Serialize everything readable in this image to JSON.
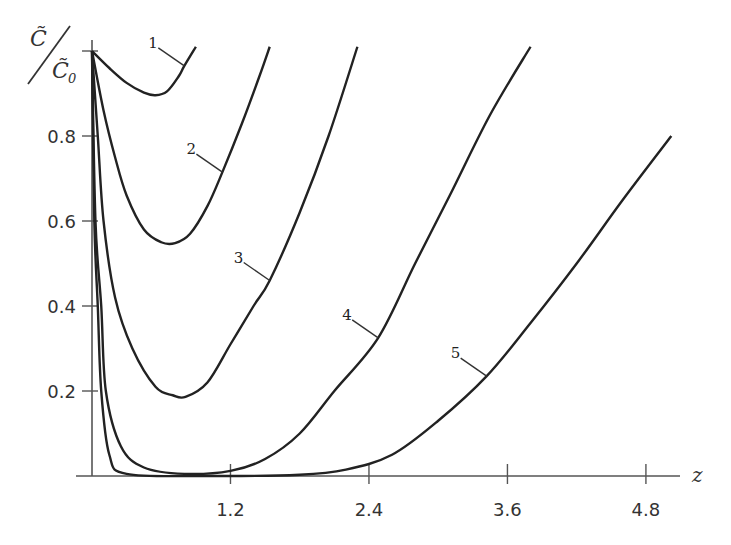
{
  "chart_data": {
    "type": "line",
    "title": "",
    "xlabel": "z",
    "ylabel": "C̃/C̃0",
    "ylabel_parts": {
      "numerator": "C̃",
      "denominator": "C̃",
      "subscript": "0"
    },
    "xlim": [
      0,
      5.1
    ],
    "ylim": [
      0,
      1.0
    ],
    "x_ticks": [
      1.2,
      2.4,
      3.6,
      4.8
    ],
    "x_tick_labels": [
      "1.2",
      "2.4",
      "3.6",
      "4.8"
    ],
    "y_ticks": [
      0.2,
      0.4,
      0.6,
      0.8,
      1.0
    ],
    "y_tick_labels": [
      "0.2",
      "0.4",
      "0.6",
      "0.8",
      ""
    ],
    "grid": false,
    "legend": "inline curve labels",
    "series": [
      {
        "name": "1",
        "points": [
          [
            0,
            1.0
          ],
          [
            0.15,
            0.96
          ],
          [
            0.3,
            0.925
          ],
          [
            0.45,
            0.902
          ],
          [
            0.55,
            0.896
          ],
          [
            0.65,
            0.905
          ],
          [
            0.75,
            0.94
          ],
          [
            0.8,
            0.965
          ],
          [
            0.9,
            1.01
          ]
        ]
      },
      {
        "name": "2",
        "points": [
          [
            0,
            1.0
          ],
          [
            0.1,
            0.86
          ],
          [
            0.2,
            0.75
          ],
          [
            0.3,
            0.66
          ],
          [
            0.45,
            0.58
          ],
          [
            0.6,
            0.55
          ],
          [
            0.72,
            0.548
          ],
          [
            0.85,
            0.57
          ],
          [
            1.0,
            0.635
          ],
          [
            1.13,
            0.715
          ],
          [
            1.3,
            0.83
          ],
          [
            1.45,
            0.94
          ],
          [
            1.54,
            1.01
          ]
        ]
      },
      {
        "name": "3",
        "points": [
          [
            0,
            1.0
          ],
          [
            0.05,
            0.8
          ],
          [
            0.1,
            0.6
          ],
          [
            0.2,
            0.42
          ],
          [
            0.35,
            0.3
          ],
          [
            0.55,
            0.21
          ],
          [
            0.7,
            0.19
          ],
          [
            0.81,
            0.186
          ],
          [
            1.0,
            0.22
          ],
          [
            1.2,
            0.31
          ],
          [
            1.4,
            0.4
          ],
          [
            1.54,
            0.46
          ],
          [
            1.8,
            0.62
          ],
          [
            2.05,
            0.8
          ],
          [
            2.3,
            1.01
          ]
        ]
      },
      {
        "name": "4",
        "points": [
          [
            0,
            1.0
          ],
          [
            0.03,
            0.6
          ],
          [
            0.08,
            0.4
          ],
          [
            0.12,
            0.2
          ],
          [
            0.25,
            0.07
          ],
          [
            0.45,
            0.02
          ],
          [
            0.8,
            0.005
          ],
          [
            1.2,
            0.012
          ],
          [
            1.5,
            0.04
          ],
          [
            1.8,
            0.1
          ],
          [
            2.1,
            0.2
          ],
          [
            2.48,
            0.325
          ],
          [
            2.8,
            0.5
          ],
          [
            3.1,
            0.66
          ],
          [
            3.45,
            0.85
          ],
          [
            3.8,
            1.01
          ]
        ]
      },
      {
        "name": "5",
        "points": [
          [
            0,
            1.0
          ],
          [
            0.02,
            0.6
          ],
          [
            0.05,
            0.4
          ],
          [
            0.08,
            0.2
          ],
          [
            0.15,
            0.05
          ],
          [
            0.3,
            0.005
          ],
          [
            1.0,
            0.0
          ],
          [
            1.8,
            0.003
          ],
          [
            2.2,
            0.015
          ],
          [
            2.6,
            0.05
          ],
          [
            3.0,
            0.13
          ],
          [
            3.42,
            0.235
          ],
          [
            3.8,
            0.36
          ],
          [
            4.2,
            0.5
          ],
          [
            4.6,
            0.65
          ],
          [
            5.02,
            0.8
          ]
        ]
      }
    ],
    "annotations": [
      {
        "text": "1",
        "at": [
          0.8,
          0.965
        ]
      },
      {
        "text": "2",
        "at": [
          1.13,
          0.715
        ]
      },
      {
        "text": "3",
        "at": [
          1.54,
          0.46
        ]
      },
      {
        "text": "4",
        "at": [
          2.48,
          0.325
        ]
      },
      {
        "text": "5",
        "at": [
          3.42,
          0.235
        ]
      }
    ]
  }
}
